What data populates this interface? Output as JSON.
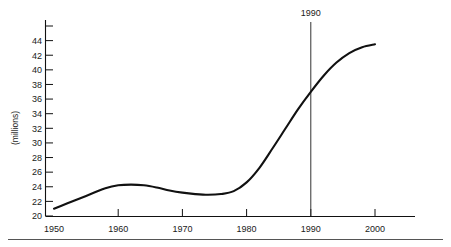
{
  "chart_data": {
    "type": "line",
    "title": "",
    "subtitle": "",
    "xlabel": "",
    "ylabel": "(millions)",
    "xlim": [
      1950,
      2003
    ],
    "ylim": [
      20,
      46
    ],
    "grid": false,
    "legend": null,
    "x_ticks": [
      1950,
      1960,
      1970,
      1980,
      1990,
      2000
    ],
    "x_tick_labels": [
      "1950",
      "1960",
      "1970",
      "1980",
      "1990",
      "2000"
    ],
    "y_ticks": [
      20,
      22,
      24,
      26,
      28,
      30,
      32,
      34,
      36,
      38,
      40,
      42,
      44,
      46
    ],
    "y_tick_labels": [
      "20",
      "22",
      "24",
      "26",
      "28",
      "30",
      "32",
      "34",
      "36",
      "38",
      "40",
      "42",
      "44",
      ""
    ],
    "series": [
      {
        "name": "population",
        "color": "#111111",
        "x": [
          1950,
          1952,
          1954,
          1956,
          1958,
          1960,
          1962,
          1964,
          1966,
          1968,
          1970,
          1972,
          1974,
          1976,
          1978,
          1980,
          1982,
          1984,
          1986,
          1988,
          1990,
          1992,
          1994,
          1996,
          1998,
          2000
        ],
        "values": [
          21.0,
          21.7,
          22.4,
          23.1,
          23.8,
          24.2,
          24.3,
          24.2,
          23.9,
          23.5,
          23.2,
          23.0,
          22.9,
          23.0,
          23.4,
          24.6,
          26.6,
          29.2,
          31.9,
          34.6,
          37.0,
          39.2,
          41.0,
          42.3,
          43.1,
          43.5
        ]
      }
    ],
    "annotations": [
      {
        "name": "year-marker",
        "label": "1990",
        "x": 1990,
        "kind": "vertical-line",
        "color": "#333333"
      }
    ]
  }
}
